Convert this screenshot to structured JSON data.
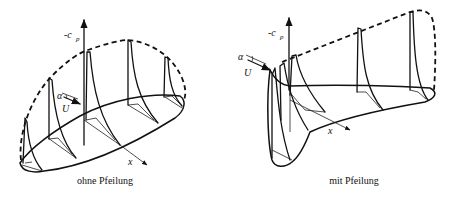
{
  "figure": {
    "panels": [
      {
        "id": "unswept",
        "caption": "ohne Pfeilung",
        "axis_label": "-c",
        "axis_sub": "p",
        "x_label": "x",
        "alpha_label": "α",
        "velocity_label": "U"
      },
      {
        "id": "swept",
        "caption": "mit Pfeilung",
        "axis_label": "-c",
        "axis_sub": "p",
        "x_label": "x",
        "alpha_label": "α",
        "velocity_label": "U"
      }
    ]
  }
}
